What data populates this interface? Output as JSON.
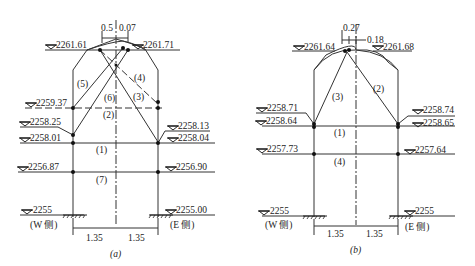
{
  "diagram_a": {
    "caption": "(a)",
    "top_left_elev": "2261.61",
    "top_right_elev": "2261.71",
    "dim_top_left": "0.5",
    "dim_top_right": "0.07",
    "w_elev_1": "2259.37",
    "w_elev_2": "2258.25",
    "w_elev_3": "2258.01",
    "w_elev_4": "2256.87",
    "w_elev_base": "2255",
    "e_elev_1": "2258.13",
    "e_elev_2": "2258.04",
    "e_elev_3": "2256.90",
    "e_elev_base": "2255.00",
    "labels": [
      "(1)",
      "(2)",
      "(3)",
      "(4)",
      "(5)",
      "(6)",
      "(7)"
    ],
    "w_side": "(W 侧)",
    "e_side": "(E 侧)",
    "span_left": "1.35",
    "span_right": "1.35"
  },
  "diagram_b": {
    "caption": "(b)",
    "top_left_elev": "2261.64",
    "top_right_elev": "2261.68",
    "dim_top_left": "0.27",
    "dim_top_right": "0.18",
    "w_elev_1": "2258.71",
    "w_elev_2": "2258.64",
    "w_elev_3": "2257.73",
    "w_elev_base": "2255",
    "e_elev_1": "2258.74",
    "e_elev_2": "2258.65",
    "e_elev_3": "2257.64",
    "e_elev_base": "2255",
    "labels": [
      "(1)",
      "(2)",
      "(3)",
      "(4)"
    ],
    "w_side": "(W 侧)",
    "e_side": "(E 侧)",
    "span_left": "1.35",
    "span_right": "1.35"
  }
}
